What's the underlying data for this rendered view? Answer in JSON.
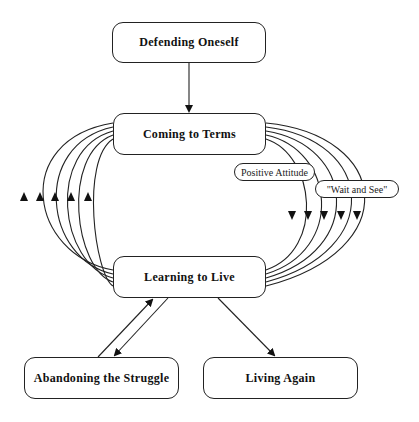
{
  "diagram": {
    "nodes": [
      {
        "id": "defending",
        "label": "Defending Oneself"
      },
      {
        "id": "coming",
        "label": "Coming to Terms"
      },
      {
        "id": "learning",
        "label": "Learning to Live"
      },
      {
        "id": "abandoning",
        "label": "Abandoning the Struggle"
      },
      {
        "id": "living",
        "label": "Living Again"
      }
    ],
    "edge_labels": [
      {
        "id": "positive",
        "label": "Positive Attitude"
      },
      {
        "id": "wait",
        "label": "\"Wait and See\""
      }
    ],
    "edges": [
      {
        "from": "defending",
        "to": "coming"
      },
      {
        "from": "coming",
        "to": "learning",
        "count": 5,
        "side": "right"
      },
      {
        "from": "learning",
        "to": "coming",
        "count": 5,
        "side": "left"
      },
      {
        "from": "learning",
        "to": "abandoning"
      },
      {
        "from": "abandoning",
        "to": "learning"
      },
      {
        "from": "learning",
        "to": "living"
      }
    ]
  }
}
